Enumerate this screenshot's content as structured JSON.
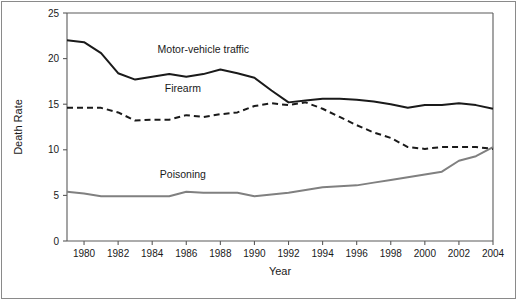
{
  "chart_data": {
    "type": "line",
    "title": "",
    "xlabel": "Year",
    "ylabel": "Death Rate",
    "xlim": [
      1979,
      2004
    ],
    "ylim": [
      0,
      25
    ],
    "grid": false,
    "legend_position": "inline-annotations",
    "xticks": [
      1980,
      1982,
      1984,
      1986,
      1988,
      1990,
      1992,
      1994,
      1996,
      1998,
      2000,
      2002,
      2004
    ],
    "xtick_labels": [
      "1980",
      "1982",
      "1984",
      "1986",
      "1988",
      "1990",
      "1992",
      "1994",
      "1996",
      "1998",
      "2000",
      "2002",
      "2004"
    ],
    "yticks": [
      0,
      5,
      10,
      15,
      20,
      25
    ],
    "ytick_labels": [
      "0",
      "5",
      "10",
      "15",
      "20",
      "25"
    ],
    "x": [
      1979,
      1980,
      1981,
      1982,
      1983,
      1984,
      1985,
      1986,
      1987,
      1988,
      1989,
      1990,
      1991,
      1992,
      1993,
      1994,
      1995,
      1996,
      1997,
      1998,
      1999,
      2000,
      2001,
      2002,
      2003,
      2004
    ],
    "series": [
      {
        "name": "Motor-vehicle traffic",
        "style": "solid",
        "color": "#1a1a1a",
        "label_x": 1987.0,
        "label_y": 20.6,
        "values": [
          22.0,
          21.8,
          20.6,
          18.4,
          17.7,
          18.0,
          18.3,
          18.0,
          18.3,
          18.8,
          18.4,
          17.9,
          16.5,
          15.2,
          15.4,
          15.6,
          15.6,
          15.5,
          15.3,
          15.0,
          14.6,
          14.9,
          14.9,
          15.1,
          14.9,
          14.5
        ]
      },
      {
        "name": "Firearm",
        "style": "dashed",
        "color": "#1a1a1a",
        "label_x": 1985.8,
        "label_y": 16.3,
        "values": [
          14.6,
          14.6,
          14.6,
          14.1,
          13.2,
          13.3,
          13.3,
          13.8,
          13.6,
          13.9,
          14.1,
          14.8,
          15.1,
          14.9,
          15.2,
          14.5,
          13.6,
          12.7,
          11.9,
          11.3,
          10.3,
          10.1,
          10.3,
          10.3,
          10.3,
          10.1
        ]
      },
      {
        "name": "Poisoning",
        "style": "solid",
        "color": "#808080",
        "label_x": 1985.8,
        "label_y": 6.9,
        "values": [
          5.4,
          5.2,
          4.9,
          4.9,
          4.9,
          4.9,
          4.9,
          5.4,
          5.3,
          5.3,
          5.3,
          4.9,
          5.1,
          5.3,
          5.6,
          5.9,
          6.0,
          6.1,
          6.4,
          6.7,
          7.0,
          7.3,
          7.6,
          8.8,
          9.3,
          10.3
        ]
      }
    ]
  }
}
